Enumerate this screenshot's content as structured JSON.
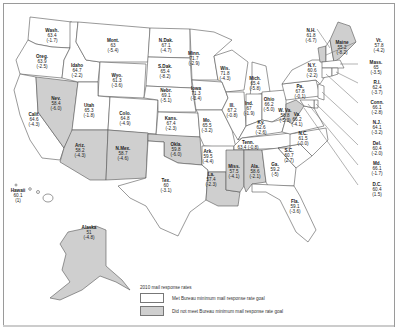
{
  "map": {
    "legend": {
      "title": "2010 mail response rates",
      "items": [
        {
          "label": "Met Bureau minimum mail response rate goal",
          "color": "#ffffff"
        },
        {
          "label": "Did not meet Bureau minimum mail response rate goal",
          "color": "#cfcfcf"
        }
      ]
    },
    "states": [
      {
        "id": "wa",
        "name": "Wash.",
        "rate": "63.4",
        "change": "(-1.7)",
        "met": true
      },
      {
        "id": "or",
        "name": "Oreg.",
        "rate": "63.9",
        "change": "(-2.5)",
        "met": true
      },
      {
        "id": "ca",
        "name": "Calif.",
        "rate": "64.6",
        "change": "(-4.3)",
        "met": true
      },
      {
        "id": "nv",
        "name": "Nev.",
        "rate": "58.4",
        "change": "(-6.0)",
        "met": false
      },
      {
        "id": "id",
        "name": "Idaho",
        "rate": "64.7",
        "change": "(-2.2)",
        "met": true
      },
      {
        "id": "mt",
        "name": "Mont.",
        "rate": "63",
        "change": "(-5.4)",
        "met": true
      },
      {
        "id": "wy",
        "name": "Wyo.",
        "rate": "61.3",
        "change": "(-3.6)",
        "met": true
      },
      {
        "id": "ut",
        "name": "Utah",
        "rate": "65.3",
        "change": "(-1.8)",
        "met": true
      },
      {
        "id": "az",
        "name": "Ariz.",
        "rate": "58.2",
        "change": "(-4.3)",
        "met": false
      },
      {
        "id": "co",
        "name": "Colo.",
        "rate": "64.8",
        "change": "(-4.9)",
        "met": true
      },
      {
        "id": "nm",
        "name": "N.Mex.",
        "rate": "58.7",
        "change": "(-4.6)",
        "met": false
      },
      {
        "id": "nd",
        "name": "N.Dak.",
        "rate": "67.1",
        "change": "(-4.7)",
        "met": true
      },
      {
        "id": "sd",
        "name": "S.Dak.",
        "rate": "65.4",
        "change": "(-8.2)",
        "met": true
      },
      {
        "id": "ne",
        "name": "Nebr.",
        "rate": "69.1",
        "change": "(-5.1)",
        "met": true
      },
      {
        "id": "ks",
        "name": "Kans.",
        "rate": "67.4",
        "change": "(-2.3)",
        "met": true
      },
      {
        "id": "ok",
        "name": "Okla.",
        "rate": "59.8",
        "change": "(-6.0)",
        "met": false
      },
      {
        "id": "tx",
        "name": "Tex.",
        "rate": "60",
        "change": "(-3.1)",
        "met": true
      },
      {
        "id": "mn",
        "name": "Minn.",
        "rate": "71.7",
        "change": "(-2.9)",
        "met": true
      },
      {
        "id": "ia",
        "name": "Iowa",
        "rate": "71.3",
        "change": "(-3.4)",
        "met": true
      },
      {
        "id": "mo",
        "name": "Mo.",
        "rate": "65.5",
        "change": "(-3.2)",
        "met": true
      },
      {
        "id": "ar",
        "name": "Ark.",
        "rate": "59.5",
        "change": "(-4.4)",
        "met": true
      },
      {
        "id": "la",
        "name": "La.",
        "rate": "57.4",
        "change": "(-2.3)",
        "met": false
      },
      {
        "id": "wi",
        "name": "Wis.",
        "rate": "71.8",
        "change": "(-4.3)",
        "met": true
      },
      {
        "id": "il",
        "name": "Ill.",
        "rate": "67.2",
        "change": "(-0.8)",
        "met": true
      },
      {
        "id": "mi",
        "name": "Mich.",
        "rate": "65.4",
        "change": "(-5.8)",
        "met": true
      },
      {
        "id": "in",
        "name": "Ind.",
        "rate": "67",
        "change": "(-1.9)",
        "met": true
      },
      {
        "id": "oh",
        "name": "Ohio",
        "rate": "66.2",
        "change": "(-5.0)",
        "met": true
      },
      {
        "id": "ky",
        "name": "Ky.",
        "rate": "62.6",
        "change": "(-2.6)",
        "met": true
      },
      {
        "id": "tn",
        "name": "Tenn.",
        "rate": "63.4",
        "change": "(-0.8)",
        "met": true
      },
      {
        "id": "ms",
        "name": "Miss.",
        "rate": "57.5",
        "change": "(-4.1)",
        "met": false
      },
      {
        "id": "al",
        "name": "Ala.",
        "rate": "58.6",
        "change": "(-2.1)",
        "met": false
      },
      {
        "id": "ga",
        "name": "Ga.",
        "rate": "59.2",
        "change": "(-5)",
        "met": true
      },
      {
        "id": "fl",
        "name": "Fla.",
        "rate": "59.1",
        "change": "(-3.6)",
        "met": true
      },
      {
        "id": "sc",
        "name": "S.C.",
        "rate": "60.7",
        "change": "(2.7)",
        "met": true
      },
      {
        "id": "nc",
        "name": "N.C.",
        "rate": "61.5",
        "change": "(-0.0)",
        "met": true
      },
      {
        "id": "va",
        "name": "Va.",
        "rate": "66.2",
        "change": "(-4.1)",
        "met": true
      },
      {
        "id": "wv",
        "name": "W. Va.",
        "rate": "58.8",
        "change": "(-5.3)",
        "met": false
      },
      {
        "id": "pa",
        "name": "Pa.",
        "rate": "67.8",
        "change": "(-0.1)",
        "met": true
      },
      {
        "id": "ny",
        "name": "N.Y.",
        "rate": "60.6",
        "change": "(-2.2)",
        "met": true
      },
      {
        "id": "nh",
        "name": "N.H.",
        "rate": "61.8",
        "change": "(-6.7)",
        "met": true
      },
      {
        "id": "me",
        "name": "Maine",
        "rate": "55.2",
        "change": "(-8.2)",
        "met": false
      },
      {
        "id": "vt",
        "name": "Vt.",
        "rate": "57.8",
        "change": "(-4.2)",
        "met": false
      },
      {
        "id": "ma",
        "name": "Mass.",
        "rate": "65",
        "change": "(-3.5)",
        "met": true
      },
      {
        "id": "ri",
        "name": "R.I.",
        "rate": "62.4",
        "change": "(-3.7)",
        "met": true
      },
      {
        "id": "ct",
        "name": "Conn.",
        "rate": "66.1",
        "change": "(-2.8)",
        "met": true
      },
      {
        "id": "nj",
        "name": "N.J.",
        "rate": "64.1",
        "change": "(-3.2)",
        "met": true
      },
      {
        "id": "de",
        "name": "Del.",
        "rate": "60.4",
        "change": "(-2.0)",
        "met": true
      },
      {
        "id": "md",
        "name": "Md.",
        "rate": "66.1",
        "change": "(-1.7)",
        "met": true
      },
      {
        "id": "dc",
        "name": "D.C.",
        "rate": "60.4",
        "change": "(1.5)",
        "met": true
      },
      {
        "id": "ak",
        "name": "Alaska",
        "rate": "51",
        "change": "(-4.8)",
        "met": false
      },
      {
        "id": "hi",
        "name": "Hawaii",
        "rate": "60.1",
        "change": "(1)",
        "met": true
      }
    ]
  }
}
